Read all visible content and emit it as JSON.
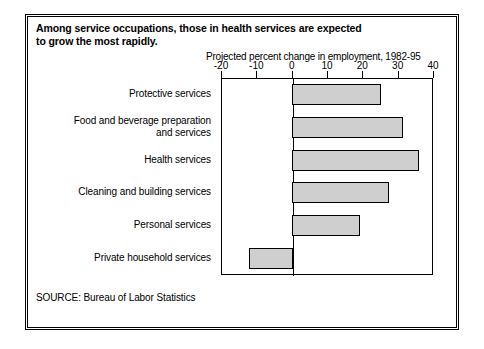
{
  "chart_data": {
    "type": "bar",
    "orientation": "horizontal",
    "title": "Among service occupations, those in health services are expected to grow the most rapidly.",
    "title_lines": [
      "Among service occupations, those in health services are expected",
      "to grow the most rapidly."
    ],
    "xlabel": "Projected percent change in employment, 1982-95",
    "ylabel": "",
    "xlim": [
      -20,
      40
    ],
    "xticks": [
      -20,
      -10,
      0,
      10,
      20,
      30,
      40
    ],
    "xticklabels": [
      "-20",
      "-10",
      "0",
      "10",
      "20",
      "30",
      "40"
    ],
    "grid": false,
    "legend": "none",
    "categories": [
      "Protective services",
      "Food and beverage preparation and services",
      "Health services",
      "Cleaning and building services",
      "Personal services",
      "Private household services"
    ],
    "category_lines": [
      [
        "Protective services"
      ],
      [
        "Food and beverage preparation",
        "and services"
      ],
      [
        "Health services"
      ],
      [
        "Cleaning and building services"
      ],
      [
        "Personal services"
      ],
      [
        "Private household services"
      ]
    ],
    "values": [
      25,
      31,
      35.5,
      27,
      19,
      -12
    ],
    "bar_fill_color": "#cfcfcf",
    "bar_edge_color": "#000000"
  },
  "source": {
    "label": "SOURCE: Bureau of Labor Statistics"
  }
}
